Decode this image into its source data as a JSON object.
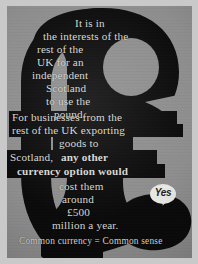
{
  "poster": {
    "medium": "political campaign poster photograph",
    "background_color": "#8d8d8d",
    "ink_color": "#0a0a0a",
    "text_color": "#d8d8d4",
    "symbol": "pound-sterling-sign",
    "symbol_glyph": "£"
  },
  "body_lines": [
    {
      "text": "It is in",
      "bold": false,
      "banded": false
    },
    {
      "text": "the interests of the",
      "bold": false,
      "banded": false
    },
    {
      "text": "rest of the",
      "bold": false,
      "banded": false
    },
    {
      "text": "UK for an",
      "bold": false,
      "banded": false
    },
    {
      "text": "independent",
      "bold": false,
      "banded": false
    },
    {
      "text": "Scotland",
      "bold": false,
      "banded": false
    },
    {
      "text": "to use the",
      "bold": false,
      "banded": false
    },
    {
      "text": "pound.",
      "bold": false,
      "banded": false
    },
    {
      "text": "For businesses from the",
      "bold": false,
      "banded": true
    },
    {
      "text": "rest of the UK exporting",
      "bold": false,
      "banded": true
    },
    {
      "text": "goods to",
      "bold": false,
      "banded": true
    },
    {
      "text": "Scotland,",
      "bold": false,
      "banded": true
    },
    {
      "text": "any other",
      "bold": true,
      "banded": true
    },
    {
      "text": "currency option would",
      "bold": true,
      "banded": true
    },
    {
      "text": "cost them",
      "bold": false,
      "banded": false
    },
    {
      "text": "around",
      "bold": false,
      "banded": false
    },
    {
      "text": "£500",
      "bold": false,
      "banded": false
    },
    {
      "text": "million a year.",
      "bold": false,
      "banded": false
    }
  ],
  "full_message": "It is in the interests of the rest of the UK for an independent Scotland to use the pound. For businesses from the rest of the UK exporting goods to Scotland, any other currency option would cost them around £500 million a year.",
  "tagline": "Common currency = Common sense",
  "logo": {
    "label": "Yes",
    "shape": "speech-bubble",
    "bubble_color": "#e8e8e4",
    "text_color": "#1c1c1c"
  }
}
